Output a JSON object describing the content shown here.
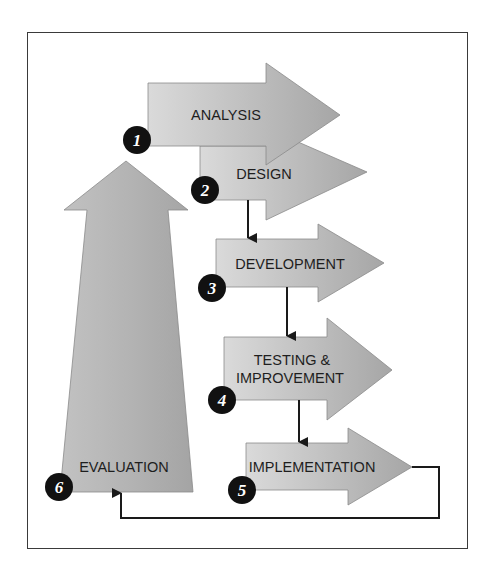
{
  "diagram": {
    "type": "process-cycle",
    "colors": {
      "arrow_fill_light": "#dadada",
      "arrow_fill_dark": "#a6a6a6",
      "arrow_stroke": "#7a7a7a",
      "badge_fill": "#111111",
      "badge_text": "#ffffff",
      "connector": "#1a1a1a",
      "frame": "#3a3a3a"
    },
    "steps": [
      {
        "number": "1",
        "label": "ANALYSIS"
      },
      {
        "number": "2",
        "label": "DESIGN"
      },
      {
        "number": "3",
        "label": "DEVELOPMENT"
      },
      {
        "number": "4",
        "label_line1": "TESTING &",
        "label_line2": "IMPROVEMENT"
      },
      {
        "number": "5",
        "label": "IMPLEMENTATION"
      },
      {
        "number": "6",
        "label": "EVALUATION"
      }
    ]
  }
}
